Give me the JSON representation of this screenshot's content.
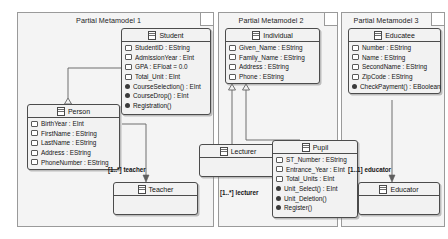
{
  "diagram": {
    "frames": [
      {
        "id": "mm1",
        "title": "Partial Metamodel 1"
      },
      {
        "id": "mm2",
        "title": "Partial Metamodel 2"
      },
      {
        "id": "mm3",
        "title": "Partial Metamodel 3"
      }
    ],
    "classes": [
      {
        "id": "student",
        "name": "Student",
        "frame": "Partial Metamodel 1",
        "features": [
          {
            "kind": "attribute",
            "text": "StudentID : EString"
          },
          {
            "kind": "attribute",
            "text": "AdmissionYear : EInt"
          },
          {
            "kind": "attribute",
            "text": "GPA : EFloat = 0.0"
          },
          {
            "kind": "attribute",
            "text": "Total_Unit : EInt"
          },
          {
            "kind": "operation",
            "text": "CourseSelection() : EInt"
          },
          {
            "kind": "operation",
            "text": "CourseDrop() : EInt"
          },
          {
            "kind": "operation",
            "text": "Registration()"
          }
        ]
      },
      {
        "id": "person",
        "name": "Person",
        "frame": "Partial Metamodel 1",
        "features": [
          {
            "kind": "attribute",
            "text": "BirthYear : EInt"
          },
          {
            "kind": "attribute",
            "text": "FirstName : EString"
          },
          {
            "kind": "attribute",
            "text": "LastName : EString"
          },
          {
            "kind": "attribute",
            "text": "Address : EString"
          },
          {
            "kind": "attribute",
            "text": "PhoneNumber : EString"
          }
        ]
      },
      {
        "id": "teacher",
        "name": "Teacher",
        "frame": "Partial Metamodel 1",
        "features": []
      },
      {
        "id": "individual",
        "name": "Individual",
        "frame": "Partial Metamodel 2",
        "features": [
          {
            "kind": "attribute",
            "text": "Given_Name : EString"
          },
          {
            "kind": "attribute",
            "text": "Family_Name : EString"
          },
          {
            "kind": "attribute",
            "text": "Address : EString"
          },
          {
            "kind": "attribute",
            "text": "Phone : EString"
          }
        ]
      },
      {
        "id": "lecturer",
        "name": "Lecturer",
        "frame": "Partial Metamodel 2",
        "features": []
      },
      {
        "id": "pupil",
        "name": "Pupil",
        "frame": "Partial Metamodel 2",
        "features": [
          {
            "kind": "attribute",
            "text": "ST_Number : EString"
          },
          {
            "kind": "attribute",
            "text": "Entrance_Year : EInt"
          },
          {
            "kind": "attribute",
            "text": "Total_Units : EInt"
          },
          {
            "kind": "operation",
            "text": "Unit_Select() : EInt"
          },
          {
            "kind": "operation",
            "text": "Unit_Deletion()"
          },
          {
            "kind": "operation",
            "text": "Register()"
          }
        ]
      },
      {
        "id": "educatee",
        "name": "Educatee",
        "frame": "Partial Metamodel 3",
        "features": [
          {
            "kind": "attribute",
            "text": "Number : EString"
          },
          {
            "kind": "attribute",
            "text": "Name : EString"
          },
          {
            "kind": "attribute",
            "text": "SecondName : EString"
          },
          {
            "kind": "attribute",
            "text": "ZipCode : EString"
          },
          {
            "kind": "operation",
            "text": "CheckPayment() : EBoolean"
          }
        ]
      },
      {
        "id": "educator",
        "name": "Educator",
        "frame": "Partial Metamodel 3",
        "features": []
      }
    ],
    "edge_labels": [
      {
        "id": "teacher_role",
        "text": "[1..*] teacher"
      },
      {
        "id": "lecturer_role",
        "text": "[1..*] lecturer"
      },
      {
        "id": "educator_role",
        "text": "[1..1] educator"
      }
    ],
    "colors": {
      "frame_fill": "#f4f4f4",
      "frame_border": "#9a9a9a",
      "class_fill": "#f2f2f2",
      "class_border": "#4c4c4c",
      "edge": "#6f6f6f",
      "text": "#141414"
    }
  }
}
